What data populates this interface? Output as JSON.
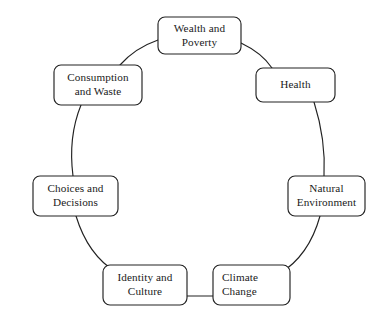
{
  "diagram": {
    "type": "cycle",
    "shape": "circular-ring",
    "background_color": "#ffffff",
    "stroke_color": "#222222",
    "text_color": "#1a1a1a",
    "node_count": 7,
    "nodes": [
      {
        "id": "wealth-and-poverty",
        "label": "Wealth and\nPoverty",
        "position": "top",
        "box": {
          "x": 158,
          "y": 17,
          "w": 83,
          "h": 37,
          "r": 7
        },
        "text_align": "center"
      },
      {
        "id": "health",
        "label": "Health",
        "position": "upper-right",
        "box": {
          "x": 256,
          "y": 68,
          "w": 79,
          "h": 34,
          "r": 7
        },
        "text_align": "center"
      },
      {
        "id": "natural-environment",
        "label": "Natural\nEnvironment",
        "position": "right",
        "box": {
          "x": 288,
          "y": 176,
          "w": 77,
          "h": 40,
          "r": 7
        },
        "text_align": "center"
      },
      {
        "id": "climate-change",
        "label": "Climate\nChange",
        "position": "lower-right",
        "box": {
          "x": 213,
          "y": 265,
          "w": 77,
          "h": 40,
          "r": 7
        },
        "text_align": "left"
      },
      {
        "id": "identity-and-culture",
        "label": "Identity and\nCulture",
        "position": "lower-left",
        "box": {
          "x": 103,
          "y": 265,
          "w": 84,
          "h": 40,
          "r": 7
        },
        "text_align": "center"
      },
      {
        "id": "choices-and-decisions",
        "label": "Choices and\nDecisions",
        "position": "left",
        "box": {
          "x": 33,
          "y": 176,
          "w": 85,
          "h": 40,
          "r": 7
        },
        "text_align": "center"
      },
      {
        "id": "consumption-and-waste",
        "label": "Consumption\nand Waste",
        "position": "upper-left",
        "box": {
          "x": 54,
          "y": 65,
          "w": 88,
          "h": 40,
          "r": 7
        },
        "text_align": "center"
      }
    ],
    "connectors": [
      {
        "id": "wealth-to-health",
        "from": "wealth-and-poverty",
        "to": "health",
        "style": "arc",
        "path": "M 241 43 Q 262 53 272 68"
      },
      {
        "id": "health-to-natural-environment",
        "from": "health",
        "to": "natural-environment",
        "style": "arc",
        "path": "M 314 102 Q 326 140 324 176"
      },
      {
        "id": "natural-environment-to-climate-change",
        "from": "natural-environment",
        "to": "climate-change",
        "style": "arc",
        "path": "M 320 216 Q 309 256 279 274"
      },
      {
        "id": "climate-change-to-identity-and-culture",
        "from": "climate-change",
        "to": "identity-and-culture",
        "style": "straight",
        "path": "M 213 296 L 187 296"
      },
      {
        "id": "identity-and-culture-to-choices-and-decisions",
        "from": "identity-and-culture",
        "to": "choices-and-decisions",
        "style": "arc",
        "path": "M 116 272 Q 88 255 76 216"
      },
      {
        "id": "choices-and-decisions-to-consumption-and-waste",
        "from": "choices-and-decisions",
        "to": "consumption-and-waste",
        "style": "arc",
        "path": "M 73 176 Q 68 137 81 105"
      },
      {
        "id": "consumption-and-waste-to-wealth",
        "from": "consumption-and-waste",
        "to": "wealth-and-poverty",
        "style": "arc",
        "path": "M 120 65 Q 135 48 158 40"
      }
    ]
  }
}
